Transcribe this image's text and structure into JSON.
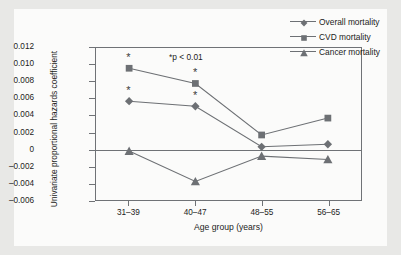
{
  "chart_data": {
    "type": "line",
    "title": "",
    "xlabel": "Age group (years)",
    "ylabel": "Univariate proportional hazards coefficient",
    "categories": [
      "31–39",
      "40–47",
      "48–55",
      "56–65"
    ],
    "ylim": [
      -0.006,
      0.012
    ],
    "yticks": [
      "0.012",
      "0.010",
      "0.008",
      "0.006",
      "0.004",
      "0.002",
      "0",
      "–0.002",
      "–0.004",
      "–0.006"
    ],
    "ytick_values": [
      0.012,
      0.01,
      0.008,
      0.006,
      0.004,
      0.002,
      0,
      -0.002,
      -0.004,
      -0.006
    ],
    "grid": false,
    "legend_position": "top-right",
    "annotation": "*p < 0.01",
    "series": [
      {
        "name": "Overall mortality",
        "marker": "diamond",
        "color": "#6d7074",
        "values": [
          0.0057,
          0.0051,
          0.0003,
          0.0006
        ],
        "significant": [
          true,
          true,
          false,
          false
        ]
      },
      {
        "name": "CVD mortality",
        "marker": "square",
        "color": "#6d7074",
        "values": [
          0.0096,
          0.0078,
          0.0017,
          0.0037
        ],
        "significant": [
          true,
          true,
          false,
          false
        ]
      },
      {
        "name": "Cancer mortality",
        "marker": "triangle",
        "color": "#6d7074",
        "values": [
          -0.0002,
          -0.0038,
          -0.0008,
          -0.0012
        ],
        "significant": [
          false,
          false,
          false,
          false
        ]
      }
    ],
    "significance_marker": "*"
  },
  "colors": {
    "page_background": "#e8e8e6",
    "figure_background": "#fbfbfa",
    "axis": "#6f7276",
    "series": "#6d7074",
    "text": "#1b1b1b"
  }
}
